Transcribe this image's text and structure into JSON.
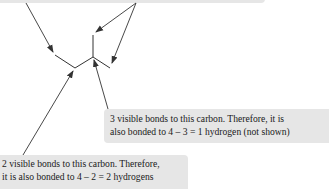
{
  "diagram": {
    "callouts": {
      "top": {
        "lines": []
      },
      "middle": {
        "lines": [
          "3 visible bonds to this carbon. Therefore, it is",
          "also bonded to 4 – 3 = 1 hydrogen (not shown)"
        ]
      },
      "bottom": {
        "lines": [
          "2 visible bonds to this carbon. Therefore,",
          "it is also bonded to 4 – 2 = 2 hydrogens"
        ]
      }
    },
    "colors": {
      "callout_background": "#e6e6e6",
      "line": "#333333",
      "text": "#1a1a1a"
    }
  }
}
